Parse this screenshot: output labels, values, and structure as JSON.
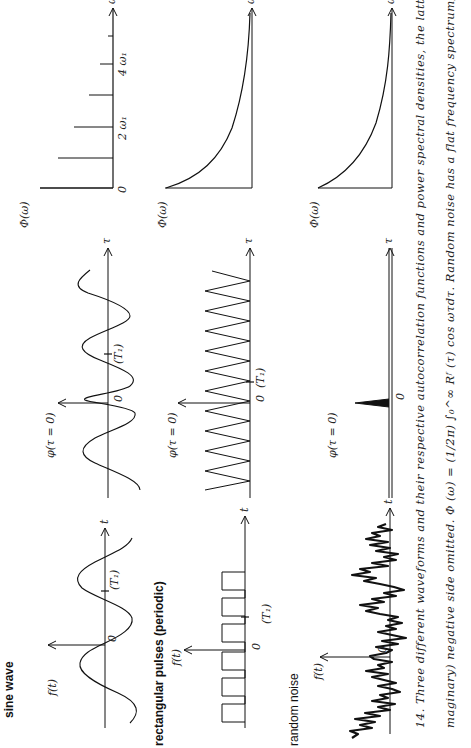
{
  "figure": {
    "rows": [
      {
        "title": "sine wave",
        "waveform": {
          "y_label": "f(t)",
          "x_label": "t",
          "origin_label": "0",
          "period_label": "(T₁)"
        },
        "autocorrelation": {
          "y_label": "φ(τ = 0)",
          "x_label": "τ",
          "origin_label": "0",
          "period_label": "(T₁)"
        },
        "spectrum": {
          "y_label": "Φ(ω)",
          "x_label": "ω",
          "origin_label": "0",
          "tick_labels": [
            "2 ω₁",
            "4 ω₁"
          ]
        }
      },
      {
        "title": "rectangular pulses (periodic)",
        "waveform": {
          "y_label": "f(t)",
          "x_label": "t",
          "origin_label": "0",
          "period_label": "(T₁)"
        },
        "autocorrelation": {
          "y_label": "φ(τ = 0)",
          "x_label": "τ",
          "origin_label": "0",
          "period_label": "(T₁)"
        },
        "spectrum": {
          "y_label": "Φ(ω)",
          "x_label": "ω"
        }
      },
      {
        "title": "random noise",
        "waveform": {
          "y_label": "f(t)",
          "x_label": "t",
          "origin_label": "0"
        },
        "autocorrelation": {
          "y_label": "φ(τ = 0)",
          "x_label": "τ",
          "origin_label": "0"
        },
        "spectrum": {
          "y_label": "Φ(ω)",
          "x_label": "ω"
        }
      }
    ],
    "caption": {
      "line1": "14.  Three different waveforms and their respective autocorrelation functions and power spectral densities, the latter with symmetric",
      "line2": "maginary) negative side omitted.  Φ (ω) = (1/2π) ∫₀^∞ Rᶠ (τ) cos ωτdτ.  Random noise has a flat frequency spectrum; the power spectral"
    },
    "rotation_deg": -90
  }
}
